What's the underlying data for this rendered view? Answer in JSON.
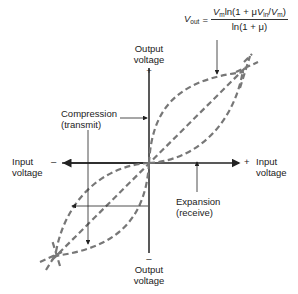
{
  "formula": {
    "lhs_var": "V",
    "lhs_sub": "out",
    "equals": "=",
    "numerator_a": "V",
    "numerator_a_sub": "m",
    "numerator_b": "ln(1 + μ",
    "numerator_c": "V",
    "numerator_c_sub": "in",
    "numerator_d": "/",
    "numerator_e": "V",
    "numerator_e_sub": "m",
    "numerator_f": ")",
    "denominator": "ln(1 + μ)"
  },
  "axes": {
    "top_label_line1": "Output",
    "top_label_line2": "voltage",
    "top_sign": "+",
    "bottom_label_line1": "Output",
    "bottom_label_line2": "voltage",
    "bottom_sign": "–",
    "left_label_line1": "Input",
    "left_label_line2": "voltage",
    "left_sign": "–",
    "right_label_line1": "Input",
    "right_label_line2": "voltage",
    "right_sign": "+"
  },
  "annotations": {
    "compression_line1": "Compression",
    "compression_line2": "(transmit)",
    "expansion_line1": "Expansion",
    "expansion_line2": "(receive)"
  },
  "colors": {
    "axis": "#222222",
    "curve": "#777777",
    "text": "#222222"
  }
}
